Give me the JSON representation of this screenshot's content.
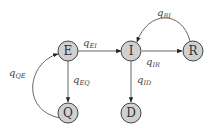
{
  "diagram": {
    "nodes": [
      {
        "id": "E",
        "label": "E"
      },
      {
        "id": "I",
        "label": "I"
      },
      {
        "id": "R",
        "label": "R"
      },
      {
        "id": "Q",
        "label": "Q"
      },
      {
        "id": "D",
        "label": "D"
      }
    ],
    "edges": [
      {
        "from": "E",
        "to": "I",
        "label": "q",
        "sub": "EI"
      },
      {
        "from": "I",
        "to": "R",
        "label": "q",
        "sub": "IR"
      },
      {
        "from": "R",
        "to": "I",
        "label": "q",
        "sub": "RI"
      },
      {
        "from": "E",
        "to": "Q",
        "label": "q",
        "sub": "EQ"
      },
      {
        "from": "Q",
        "to": "E",
        "label": "q",
        "sub": "QE"
      },
      {
        "from": "I",
        "to": "D",
        "label": "q",
        "sub": "ID"
      }
    ]
  }
}
